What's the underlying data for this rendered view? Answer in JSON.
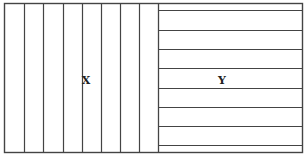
{
  "diagram": {
    "type": "two-region striped rectangle",
    "stroke_color": "#444444",
    "background": "#ffffff",
    "outer_box": {
      "x": 4.5,
      "y": 3.5,
      "width": 298,
      "height": 149
    },
    "divider_x": 158.5,
    "regions": [
      {
        "label": "X",
        "orientation": "vertical-lines",
        "label_pos": {
          "x": 86,
          "y": 80
        },
        "lines_x": [
          24,
          43,
          63,
          82,
          101,
          120,
          139
        ]
      },
      {
        "label": "Y",
        "orientation": "horizontal-lines",
        "label_pos": {
          "x": 222,
          "y": 80
        },
        "lines_y": [
          10,
          30,
          49,
          68,
          88,
          107,
          126,
          145
        ]
      }
    ]
  }
}
